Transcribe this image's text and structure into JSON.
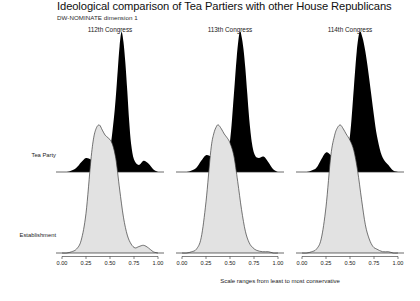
{
  "chart_data": {
    "type": "area",
    "title": "Ideological comparison of Tea Partiers with other House Republicans",
    "subtitle": "DW-NOMINATE dimension 1",
    "xlabel": "Scale ranges from least to most conservative",
    "ylabel": "",
    "xlim": [
      0.0,
      1.0
    ],
    "grid": false,
    "legend_position": "row-labels-left",
    "tick_labels": [
      "0.00",
      "0.25",
      "0.50",
      "0.75",
      "1.00"
    ],
    "tick_values": [
      0.0,
      0.25,
      0.5,
      0.75,
      1.0
    ],
    "row_labels": [
      "Tea Party",
      "Establishment"
    ],
    "group_colors": {
      "tea_party_fill": "#000000",
      "establishment_fill": "#e2e2e2",
      "establishment_stroke": "#3c3c3c",
      "axis": "#2b2b2b"
    },
    "panels": [
      {
        "label": "112th Congress",
        "series": [
          {
            "name": "Tea Party",
            "fill": "#000000",
            "peak_x": 0.62,
            "peak_density": 1.0,
            "x": [
              0.0,
              0.05,
              0.1,
              0.15,
              0.2,
              0.25,
              0.3,
              0.35,
              0.4,
              0.45,
              0.5,
              0.55,
              0.58,
              0.6,
              0.62,
              0.64,
              0.66,
              0.68,
              0.7,
              0.72,
              0.75,
              0.8,
              0.85,
              0.9,
              0.95,
              1.0
            ],
            "values": [
              0.0,
              0.0,
              0.01,
              0.03,
              0.07,
              0.1,
              0.09,
              0.07,
              0.07,
              0.09,
              0.16,
              0.45,
              0.72,
              0.9,
              1.0,
              0.93,
              0.78,
              0.58,
              0.36,
              0.2,
              0.09,
              0.05,
              0.08,
              0.06,
              0.02,
              0.0
            ]
          },
          {
            "name": "Establishment",
            "fill": "#e2e2e2",
            "peak_x": 0.39,
            "peak_density": 1.0,
            "x": [
              0.0,
              0.05,
              0.1,
              0.15,
              0.2,
              0.25,
              0.3,
              0.33,
              0.36,
              0.39,
              0.42,
              0.45,
              0.48,
              0.52,
              0.56,
              0.6,
              0.64,
              0.68,
              0.72,
              0.76,
              0.8,
              0.85,
              0.9,
              0.95,
              1.0
            ],
            "values": [
              0.0,
              0.0,
              0.01,
              0.03,
              0.1,
              0.31,
              0.72,
              0.9,
              0.98,
              1.0,
              0.96,
              0.92,
              0.9,
              0.86,
              0.74,
              0.5,
              0.28,
              0.14,
              0.07,
              0.04,
              0.05,
              0.06,
              0.04,
              0.01,
              0.0
            ]
          }
        ]
      },
      {
        "label": "113th Congress",
        "series": [
          {
            "name": "Tea Party",
            "fill": "#000000",
            "peak_x": 0.6,
            "peak_density": 1.0,
            "x": [
              0.0,
              0.05,
              0.1,
              0.15,
              0.2,
              0.25,
              0.3,
              0.35,
              0.4,
              0.45,
              0.5,
              0.54,
              0.57,
              0.6,
              0.62,
              0.64,
              0.66,
              0.68,
              0.7,
              0.73,
              0.76,
              0.8,
              0.85,
              0.9,
              0.95,
              1.0
            ],
            "values": [
              0.0,
              0.0,
              0.01,
              0.03,
              0.08,
              0.12,
              0.11,
              0.08,
              0.08,
              0.11,
              0.22,
              0.55,
              0.82,
              1.0,
              0.97,
              0.88,
              0.74,
              0.56,
              0.38,
              0.2,
              0.12,
              0.1,
              0.11,
              0.07,
              0.02,
              0.0
            ]
          },
          {
            "name": "Establishment",
            "fill": "#e2e2e2",
            "peak_x": 0.38,
            "peak_density": 1.0,
            "x": [
              0.0,
              0.05,
              0.1,
              0.15,
              0.2,
              0.25,
              0.3,
              0.33,
              0.36,
              0.38,
              0.41,
              0.44,
              0.47,
              0.5,
              0.54,
              0.58,
              0.62,
              0.66,
              0.7,
              0.74,
              0.78,
              0.84,
              0.9,
              0.95,
              1.0
            ],
            "values": [
              0.0,
              0.0,
              0.01,
              0.03,
              0.12,
              0.4,
              0.8,
              0.93,
              0.99,
              1.0,
              0.97,
              0.93,
              0.9,
              0.86,
              0.76,
              0.56,
              0.34,
              0.17,
              0.08,
              0.04,
              0.02,
              0.01,
              0.01,
              0.0,
              0.0
            ]
          }
        ]
      },
      {
        "label": "114th Congress",
        "series": [
          {
            "name": "Tea Party",
            "fill": "#000000",
            "peak_x": 0.6,
            "peak_density": 1.0,
            "x": [
              0.0,
              0.05,
              0.1,
              0.15,
              0.2,
              0.25,
              0.3,
              0.35,
              0.4,
              0.45,
              0.5,
              0.54,
              0.57,
              0.6,
              0.63,
              0.66,
              0.69,
              0.72,
              0.75,
              0.78,
              0.82,
              0.86,
              0.9,
              0.95,
              1.0
            ],
            "values": [
              0.0,
              0.0,
              0.01,
              0.03,
              0.09,
              0.14,
              0.12,
              0.08,
              0.08,
              0.12,
              0.26,
              0.6,
              0.86,
              1.0,
              0.96,
              0.86,
              0.72,
              0.56,
              0.4,
              0.26,
              0.14,
              0.08,
              0.05,
              0.01,
              0.0
            ]
          },
          {
            "name": "Establishment",
            "fill": "#e2e2e2",
            "peak_x": 0.4,
            "peak_density": 1.0,
            "x": [
              0.0,
              0.05,
              0.1,
              0.15,
              0.2,
              0.25,
              0.3,
              0.34,
              0.37,
              0.4,
              0.43,
              0.46,
              0.5,
              0.54,
              0.58,
              0.62,
              0.66,
              0.7,
              0.74,
              0.78,
              0.84,
              0.9,
              0.95,
              1.0
            ],
            "values": [
              0.0,
              0.0,
              0.01,
              0.03,
              0.11,
              0.36,
              0.76,
              0.92,
              0.98,
              1.0,
              0.97,
              0.93,
              0.88,
              0.8,
              0.64,
              0.42,
              0.22,
              0.11,
              0.05,
              0.03,
              0.01,
              0.01,
              0.0,
              0.0
            ]
          }
        ]
      }
    ]
  }
}
